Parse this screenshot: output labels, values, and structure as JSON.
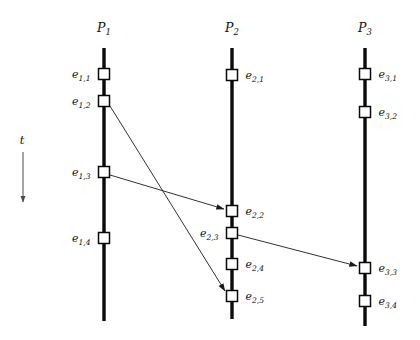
{
  "figure": {
    "type": "space-time-diagram",
    "title": "",
    "background_color": "#ffffff",
    "line_color": "#0a0a0a",
    "event_fill_color": "#ffffff",
    "message_color": "#1a1a1a",
    "width": 420,
    "height": 340
  },
  "time_axis": {
    "label": "t",
    "label_x": 22,
    "label_y": 144,
    "x": 23,
    "y_start": 152,
    "y_end": 202,
    "direction": "down"
  },
  "processes": [
    {
      "id": "P1",
      "name": "P",
      "subscript": "1",
      "label_x": 104,
      "label_y": 32,
      "line_x": 104,
      "line_top": 48,
      "line_bottom": 321,
      "events": [
        {
          "id": "e11",
          "name": "e",
          "subscript": "1,1",
          "x": 104,
          "y": 74,
          "label_side": "left"
        },
        {
          "id": "e12",
          "name": "e",
          "subscript": "1,2",
          "x": 104,
          "y": 101,
          "label_side": "left"
        },
        {
          "id": "e13",
          "name": "e",
          "subscript": "1,3",
          "x": 104,
          "y": 172,
          "label_side": "left"
        },
        {
          "id": "e14",
          "name": "e",
          "subscript": "1,4",
          "x": 104,
          "y": 238,
          "label_side": "left"
        }
      ]
    },
    {
      "id": "P2",
      "name": "P",
      "subscript": "2",
      "label_x": 232,
      "label_y": 32,
      "line_x": 232,
      "line_top": 48,
      "line_bottom": 319,
      "events": [
        {
          "id": "e21",
          "name": "e",
          "subscript": "2,1",
          "x": 232,
          "y": 75,
          "label_side": "right"
        },
        {
          "id": "e22",
          "name": "e",
          "subscript": "2,2",
          "x": 232,
          "y": 211,
          "label_side": "right"
        },
        {
          "id": "e23",
          "name": "e",
          "subscript": "2,3",
          "x": 232,
          "y": 233,
          "label_side": "left"
        },
        {
          "id": "e24",
          "name": "e",
          "subscript": "2,4",
          "x": 232,
          "y": 264,
          "label_side": "right"
        },
        {
          "id": "e25",
          "name": "e",
          "subscript": "2,5",
          "x": 232,
          "y": 296,
          "label_side": "right"
        }
      ]
    },
    {
      "id": "P3",
      "name": "P",
      "subscript": "3",
      "label_x": 365,
      "label_y": 32,
      "line_x": 365,
      "line_top": 48,
      "line_bottom": 326,
      "events": [
        {
          "id": "e31",
          "name": "e",
          "subscript": "3,1",
          "x": 365,
          "y": 74,
          "label_side": "right"
        },
        {
          "id": "e32",
          "name": "e",
          "subscript": "3,2",
          "x": 365,
          "y": 112,
          "label_side": "right"
        },
        {
          "id": "e33",
          "name": "e",
          "subscript": "3,3",
          "x": 365,
          "y": 268,
          "label_side": "right"
        },
        {
          "id": "e34",
          "name": "e",
          "subscript": "3,4",
          "x": 365,
          "y": 301,
          "label_side": "right"
        }
      ]
    }
  ],
  "messages": [
    {
      "id": "m1",
      "from": "e12",
      "to": "e25",
      "x1": 110,
      "y1": 106,
      "x2": 225,
      "y2": 291
    },
    {
      "id": "m2",
      "from": "e13",
      "to": "e22",
      "x1": 110,
      "y1": 175,
      "x2": 224,
      "y2": 209
    },
    {
      "id": "m3",
      "from": "e23",
      "to": "e33",
      "x1": 238,
      "y1": 235,
      "x2": 357,
      "y2": 266
    }
  ],
  "geometry": {
    "event_square_size": 11,
    "process_line_width": 3.4,
    "message_line_width": 0.9,
    "label_gap": 8
  }
}
